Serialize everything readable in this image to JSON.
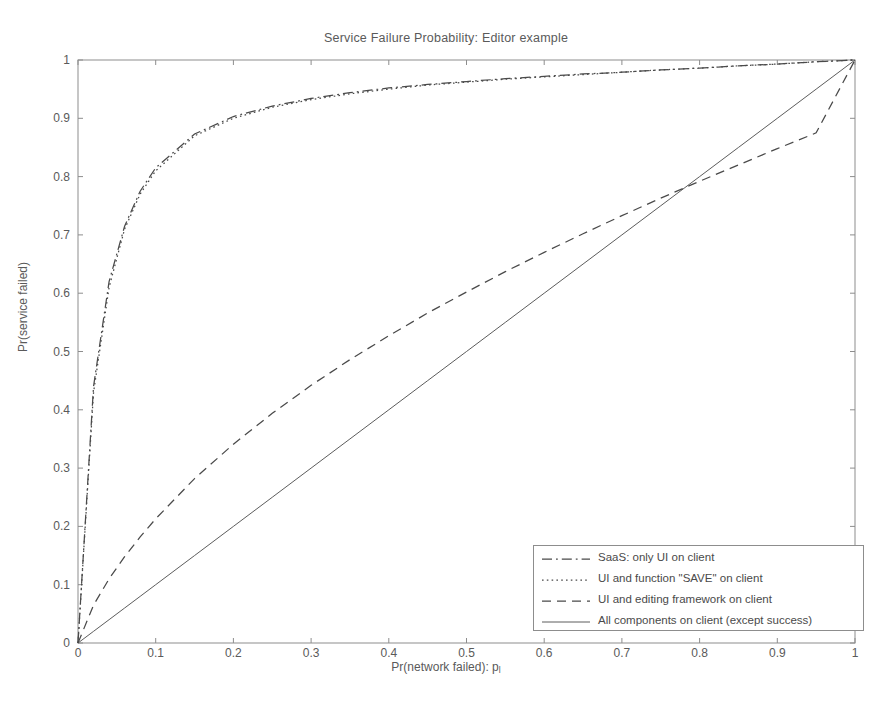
{
  "chart_data": {
    "type": "line",
    "title": "Service Failure Probability: Editor example",
    "xlabel": "Pr(network failed): p",
    "xlabel_sub": "l",
    "ylabel": "Pr(service failed)",
    "xlim": [
      0,
      1
    ],
    "ylim": [
      0,
      1
    ],
    "grid": false,
    "legend_position": "lower right",
    "x_ticks": [
      "0",
      "0.1",
      "0.2",
      "0.3",
      "0.4",
      "0.5",
      "0.6",
      "0.7",
      "0.8",
      "0.9",
      "1"
    ],
    "y_ticks": [
      "0",
      "0.1",
      "0.2",
      "0.3",
      "0.4",
      "0.5",
      "0.6",
      "0.7",
      "0.8",
      "0.9",
      "1"
    ],
    "x": [
      0,
      0.02,
      0.04,
      0.06,
      0.08,
      0.1,
      0.15,
      0.2,
      0.25,
      0.3,
      0.35,
      0.4,
      0.45,
      0.5,
      0.55,
      0.6,
      0.65,
      0.7,
      0.75,
      0.8,
      0.85,
      0.9,
      0.95,
      1
    ],
    "series": [
      {
        "name": "SaaS: only UI on client",
        "style": "dashdot",
        "values": [
          0,
          0.44,
          0.62,
          0.715,
          0.775,
          0.815,
          0.873,
          0.903,
          0.921,
          0.934,
          0.944,
          0.952,
          0.958,
          0.963,
          0.968,
          0.972,
          0.976,
          0.979,
          0.983,
          0.986,
          0.99,
          0.993,
          0.997,
          1
        ]
      },
      {
        "name": "UI and function \"SAVE\" on client",
        "style": "dotted",
        "values": [
          0,
          0.43,
          0.61,
          0.71,
          0.77,
          0.81,
          0.87,
          0.9,
          0.919,
          0.932,
          0.942,
          0.95,
          0.957,
          0.962,
          0.967,
          0.971,
          0.975,
          0.979,
          0.983,
          0.986,
          0.99,
          0.993,
          0.997,
          1
        ]
      },
      {
        "name": "UI and editing framework on client",
        "style": "dashed",
        "values": [
          0,
          0.065,
          0.11,
          0.148,
          0.182,
          0.213,
          0.282,
          0.341,
          0.394,
          0.442,
          0.486,
          0.527,
          0.566,
          0.602,
          0.637,
          0.67,
          0.702,
          0.733,
          0.763,
          0.792,
          0.82,
          0.848,
          0.875,
          1
        ]
      },
      {
        "name": "All components on client (except success)",
        "style": "solid",
        "values": [
          0,
          0.02,
          0.04,
          0.06,
          0.08,
          0.1,
          0.15,
          0.2,
          0.25,
          0.3,
          0.35,
          0.4,
          0.45,
          0.5,
          0.55,
          0.6,
          0.65,
          0.7,
          0.75,
          0.8,
          0.85,
          0.9,
          0.95,
          1
        ]
      }
    ],
    "colors": {
      "axis": "#8d8d8d",
      "curve": "#4a4a4a",
      "text": "#5a5a5a"
    }
  }
}
